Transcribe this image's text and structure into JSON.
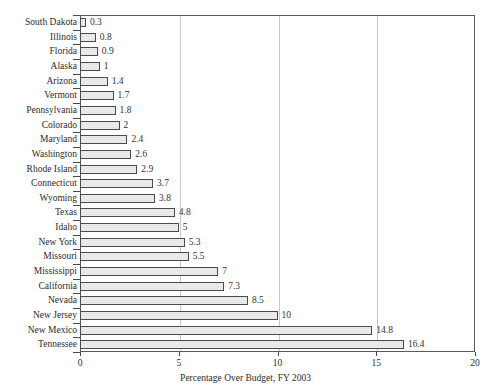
{
  "chart_data": {
    "type": "bar",
    "orientation": "horizontal",
    "title": "",
    "xlabel": "Percentage Over Budget, FY 2003",
    "ylabel": "",
    "xlim": [
      0,
      20
    ],
    "xticks": [
      0,
      5,
      10,
      15,
      20
    ],
    "xtick_labels": [
      "0",
      "5",
      "10",
      "15",
      "20"
    ],
    "grid": "vertical",
    "legend": "none",
    "bar_fill_color": "#e9e9e9",
    "bar_border_color": "#4a4a4a",
    "gridline_color": "#c8c8c8",
    "axis_color": "#5a5a5a",
    "categories": [
      "South Dakota",
      "Illinois",
      "Florida",
      "Alaska",
      "Arizona",
      "Vermont",
      "Pennsylvania",
      "Colorado",
      "Maryland",
      "Washington",
      "Rhode Island",
      "Connecticut",
      "Wyoming",
      "Texas",
      "Idaho",
      "New York",
      "Missouri",
      "Mississippi",
      "California",
      "Nevada",
      "New Jersey",
      "New Mexico",
      "Tennessee"
    ],
    "values": [
      0.3,
      0.8,
      0.9,
      1,
      1.4,
      1.7,
      1.8,
      2,
      2.4,
      2.6,
      2.9,
      3.7,
      3.8,
      4.8,
      5,
      5.3,
      5.5,
      7,
      7.3,
      8.5,
      10,
      14.8,
      16.4
    ],
    "value_labels": [
      "0.3",
      "0.8",
      "0.9",
      "1",
      "1.4",
      "1.7",
      "1.8",
      "2",
      "2.4",
      "2.6",
      "2.9",
      "3.7",
      "3.8",
      "4.8",
      "5",
      "5.3",
      "5.5",
      "7",
      "7.3",
      "8.5",
      "10",
      "14.8",
      "16.4"
    ]
  }
}
